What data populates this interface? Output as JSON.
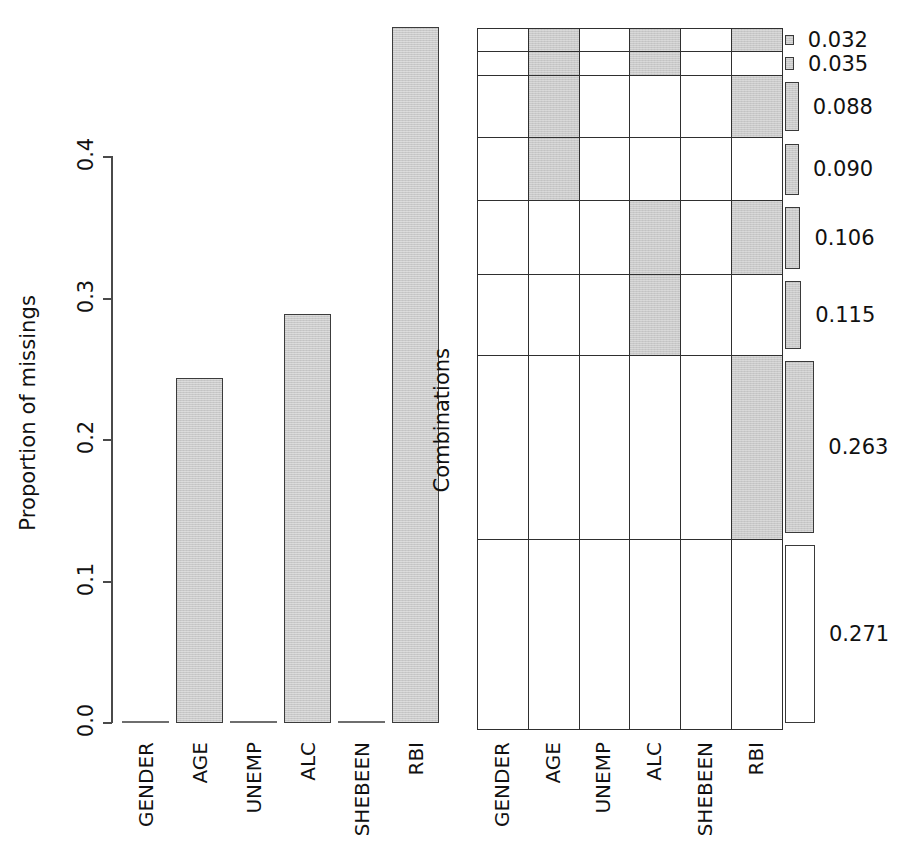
{
  "chart_data": [
    {
      "type": "bar",
      "title": "",
      "xlabel": "",
      "ylabel": "Proportion of missings",
      "categories": [
        "GENDER",
        "AGE",
        "UNEMP",
        "ALC",
        "SHEBEEN",
        "RBI"
      ],
      "values": [
        0.0,
        0.243,
        0.0,
        0.288,
        0.0,
        0.49
      ],
      "ylim": [
        0.0,
        0.49
      ],
      "yticks": [
        0.0,
        0.1,
        0.2,
        0.3,
        0.4
      ],
      "ytick_labels": [
        "0.0",
        "0.1",
        "0.2",
        "0.3",
        "0.4"
      ],
      "grid": false,
      "legend": "none",
      "bar_fill": "#c9c9c9",
      "bar_border": "#3c3c3c"
    },
    {
      "type": "heatmap",
      "title": "",
      "xlabel": "",
      "ylabel": "Combinations",
      "categories": [
        "GENDER",
        "AGE",
        "UNEMP",
        "ALC",
        "SHEBEEN",
        "RBI"
      ],
      "row_values": [
        0.032,
        0.035,
        0.088,
        0.09,
        0.106,
        0.115,
        0.263,
        0.271
      ],
      "row_labels": [
        "0.032",
        "0.035",
        "0.088",
        "0.090",
        "0.106",
        "0.115",
        "0.263",
        "0.271"
      ],
      "matrix": [
        [
          0,
          1,
          0,
          1,
          0,
          1
        ],
        [
          0,
          1,
          0,
          1,
          0,
          0
        ],
        [
          0,
          1,
          0,
          0,
          0,
          1
        ],
        [
          0,
          1,
          0,
          0,
          0,
          0
        ],
        [
          0,
          0,
          0,
          1,
          0,
          1
        ],
        [
          0,
          0,
          0,
          1,
          0,
          0
        ],
        [
          0,
          0,
          0,
          0,
          0,
          1
        ],
        [
          0,
          0,
          0,
          0,
          0,
          0
        ]
      ],
      "legend_position": "right",
      "cell_missing_color": "#c9c9c9",
      "cell_observed_color": "#ffffff",
      "grid_line_color": "#2f2f2f"
    }
  ],
  "left_panel": {
    "y_axis_label": "Proportion of missings",
    "y_tick_labels": [
      "0.0",
      "0.1",
      "0.2",
      "0.3",
      "0.4"
    ],
    "x_tick_labels": [
      "GENDER",
      "AGE",
      "UNEMP",
      "ALC",
      "SHEBEEN",
      "RBI"
    ]
  },
  "right_panel": {
    "y_axis_label": "Combinations",
    "x_tick_labels": [
      "GENDER",
      "AGE",
      "UNEMP",
      "ALC",
      "SHEBEEN",
      "RBI"
    ],
    "legend_labels": [
      "0.032",
      "0.035",
      "0.088",
      "0.090",
      "0.106",
      "0.115",
      "0.263",
      "0.271"
    ]
  }
}
